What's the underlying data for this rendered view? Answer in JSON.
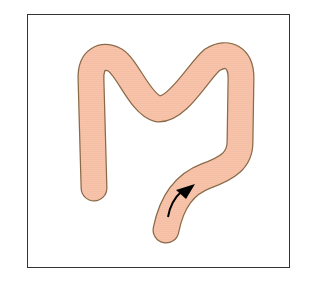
{
  "diagram": {
    "labels": [],
    "colors": {
      "tube_fill": "#f7c4aa",
      "tube_outline": "#8a6a48",
      "arrow": "#000000",
      "frame": "#333333",
      "background": "#ffffff"
    },
    "arrow": {
      "direction": "up-right",
      "meaning": "direction of flow"
    }
  }
}
